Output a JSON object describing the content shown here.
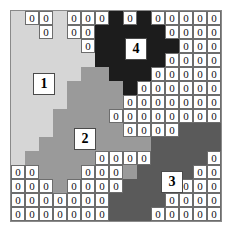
{
  "figure": {
    "grid": {
      "rows": 15,
      "cols": 15
    },
    "palette": {
      "region1": "#d6d6d6",
      "region2": "#9a9a9a",
      "region3": "#5a5a5a",
      "region4": "#1c1c1c",
      "cell_box_fill": "#ffffff",
      "cell_box_border": "#6d6d6d",
      "grid_border": "#8a8a8a",
      "background": "#ffffff"
    },
    "zero_token": "0",
    "region_labels": [
      {
        "id": "1",
        "text": "1",
        "region": "region1",
        "left": 33,
        "top": 73
      },
      {
        "id": "2",
        "text": "2",
        "region": "region2",
        "left": 74,
        "top": 128
      },
      {
        "id": "3",
        "text": "3",
        "region": "region3",
        "left": 161,
        "top": 171
      },
      {
        "id": "4",
        "text": "4",
        "region": "region4",
        "left": 125,
        "top": 38
      }
    ],
    "region_map": [
      [
        1,
        1,
        1,
        1,
        1,
        1,
        1,
        4,
        4,
        4,
        4,
        4,
        4,
        4,
        4
      ],
      [
        1,
        1,
        1,
        1,
        1,
        1,
        4,
        4,
        4,
        4,
        4,
        4,
        4,
        4,
        4
      ],
      [
        1,
        1,
        1,
        1,
        1,
        1,
        4,
        4,
        4,
        4,
        4,
        4,
        4,
        4,
        4
      ],
      [
        1,
        1,
        1,
        1,
        1,
        1,
        4,
        4,
        4,
        4,
        4,
        4,
        4,
        4,
        4
      ],
      [
        1,
        1,
        1,
        1,
        1,
        2,
        2,
        4,
        4,
        4,
        4,
        4,
        4,
        4,
        4
      ],
      [
        1,
        1,
        1,
        1,
        2,
        2,
        2,
        2,
        4,
        4,
        4,
        4,
        4,
        4,
        4
      ],
      [
        1,
        1,
        1,
        1,
        2,
        2,
        2,
        2,
        2,
        4,
        4,
        4,
        4,
        4,
        4
      ],
      [
        1,
        1,
        1,
        2,
        2,
        2,
        2,
        2,
        2,
        2,
        4,
        4,
        4,
        4,
        4
      ],
      [
        1,
        1,
        1,
        2,
        2,
        2,
        2,
        2,
        2,
        2,
        3,
        3,
        3,
        3,
        3
      ],
      [
        1,
        1,
        2,
        2,
        2,
        2,
        2,
        2,
        2,
        2,
        3,
        3,
        3,
        3,
        3
      ],
      [
        1,
        2,
        2,
        2,
        2,
        2,
        2,
        2,
        2,
        3,
        3,
        3,
        3,
        3,
        3
      ],
      [
        2,
        2,
        2,
        2,
        2,
        2,
        2,
        2,
        2,
        3,
        3,
        3,
        3,
        3,
        3
      ],
      [
        2,
        2,
        2,
        2,
        2,
        2,
        2,
        2,
        3,
        3,
        3,
        3,
        3,
        3,
        3
      ],
      [
        2,
        2,
        2,
        2,
        2,
        2,
        2,
        3,
        3,
        3,
        3,
        3,
        3,
        3,
        3
      ],
      [
        2,
        2,
        2,
        2,
        2,
        2,
        2,
        3,
        3,
        3,
        3,
        3,
        3,
        3,
        3
      ]
    ],
    "zero_map": [
      [
        0,
        1,
        1,
        0,
        1,
        1,
        1,
        0,
        1,
        0,
        1,
        1,
        1,
        1,
        1
      ],
      [
        0,
        0,
        1,
        0,
        1,
        1,
        0,
        0,
        0,
        0,
        0,
        1,
        1,
        1,
        1
      ],
      [
        0,
        0,
        0,
        0,
        0,
        1,
        0,
        0,
        0,
        0,
        0,
        0,
        1,
        1,
        1
      ],
      [
        0,
        0,
        0,
        0,
        0,
        0,
        0,
        0,
        0,
        0,
        0,
        1,
        1,
        1,
        1
      ],
      [
        0,
        0,
        0,
        0,
        0,
        0,
        0,
        0,
        0,
        0,
        1,
        1,
        1,
        1,
        1
      ],
      [
        0,
        0,
        0,
        0,
        0,
        0,
        0,
        0,
        0,
        1,
        1,
        1,
        1,
        1,
        1
      ],
      [
        0,
        0,
        0,
        0,
        0,
        0,
        0,
        0,
        1,
        1,
        1,
        1,
        1,
        1,
        1
      ],
      [
        0,
        0,
        0,
        0,
        0,
        0,
        0,
        1,
        1,
        1,
        1,
        1,
        1,
        1,
        1
      ],
      [
        0,
        0,
        0,
        0,
        0,
        0,
        0,
        0,
        1,
        1,
        1,
        1,
        0,
        0,
        0
      ],
      [
        0,
        0,
        0,
        0,
        0,
        0,
        0,
        0,
        0,
        0,
        0,
        0,
        0,
        0,
        0
      ],
      [
        0,
        0,
        0,
        0,
        0,
        0,
        1,
        1,
        1,
        1,
        0,
        0,
        0,
        0,
        1
      ],
      [
        1,
        1,
        0,
        0,
        0,
        1,
        1,
        1,
        0,
        0,
        0,
        0,
        0,
        1,
        1
      ],
      [
        1,
        1,
        1,
        0,
        1,
        1,
        1,
        1,
        0,
        0,
        0,
        0,
        1,
        1,
        1
      ],
      [
        1,
        1,
        1,
        1,
        1,
        1,
        1,
        0,
        0,
        0,
        0,
        1,
        1,
        1,
        1
      ],
      [
        1,
        1,
        1,
        1,
        1,
        1,
        1,
        0,
        0,
        0,
        1,
        1,
        1,
        1,
        1
      ]
    ]
  }
}
